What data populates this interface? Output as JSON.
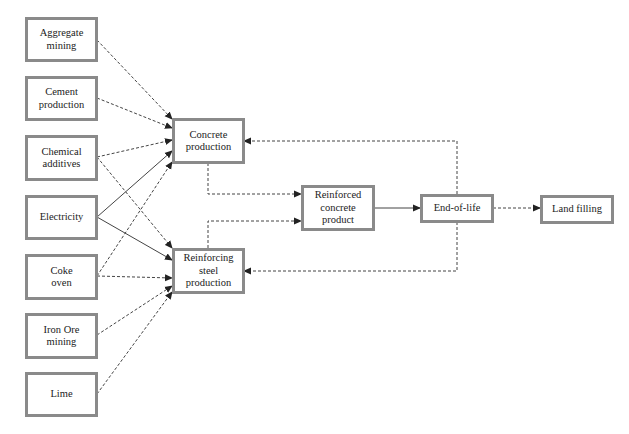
{
  "diagram": {
    "type": "flowchart",
    "nodes": {
      "aggregate_mining": {
        "label": "Aggregate mining"
      },
      "cement_production": {
        "label": "Cement production"
      },
      "chemical_additives": {
        "label": "Chemical additives"
      },
      "electricity": {
        "label": "Electricity"
      },
      "coke_oven": {
        "label": "Coke oven"
      },
      "iron_ore_mining": {
        "label": "Iron Ore mining"
      },
      "lime": {
        "label": "Lime"
      },
      "concrete_production": {
        "label": "Concrete production"
      },
      "reinforcing_steel_production": {
        "label": "Reinforcing steel production"
      },
      "reinforced_concrete_product": {
        "label": "Reinforced concrete product"
      },
      "end_of_life": {
        "label": "End-of-life"
      },
      "land_filling": {
        "label": "Land filling"
      }
    },
    "edges": [
      {
        "from": "Aggregate mining",
        "to": "Concrete production",
        "style": "dashed"
      },
      {
        "from": "Cement production",
        "to": "Concrete production",
        "style": "dashed"
      },
      {
        "from": "Chemical additives",
        "to": "Concrete production",
        "style": "dashed"
      },
      {
        "from": "Chemical additives",
        "to": "Reinforcing steel production",
        "style": "dashed"
      },
      {
        "from": "Electricity",
        "to": "Concrete production",
        "style": "solid"
      },
      {
        "from": "Electricity",
        "to": "Reinforcing steel production",
        "style": "solid"
      },
      {
        "from": "Coke oven",
        "to": "Concrete production",
        "style": "dashed"
      },
      {
        "from": "Coke oven",
        "to": "Reinforcing steel production",
        "style": "dashed"
      },
      {
        "from": "Iron Ore mining",
        "to": "Reinforcing steel production",
        "style": "dashed"
      },
      {
        "from": "Lime",
        "to": "Reinforcing steel production",
        "style": "dashed"
      },
      {
        "from": "Concrete production",
        "to": "Reinforced concrete product",
        "style": "dashed"
      },
      {
        "from": "Reinforcing steel production",
        "to": "Reinforced concrete product",
        "style": "dashed"
      },
      {
        "from": "Reinforced concrete product",
        "to": "End-of-life",
        "style": "solid"
      },
      {
        "from": "End-of-life",
        "to": "Land filling",
        "style": "dashed"
      },
      {
        "from": "End-of-life",
        "to": "Concrete production",
        "style": "dashed"
      },
      {
        "from": "End-of-life",
        "to": "Reinforcing steel production",
        "style": "dashed"
      }
    ],
    "colors": {
      "box_border": "#8a8a8a",
      "line": "#333333",
      "background": "#ffffff"
    }
  }
}
